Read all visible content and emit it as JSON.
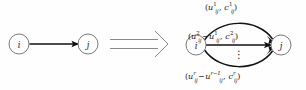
{
  "figure": {
    "background_color": "#fefefe",
    "stroke_color": "#111111",
    "node_stroke_color": "#6b6b6b",
    "implies_color": "#8a8a8a",
    "width": 306,
    "height": 90
  },
  "left_graph": {
    "name": "original-arc",
    "source_node": {
      "label": "i",
      "cx": 19,
      "cy": 44,
      "r": 10
    },
    "target_node": {
      "label": "j",
      "cx": 88,
      "cy": 44,
      "r": 10
    },
    "edge_count": 1
  },
  "implies": {
    "symbol": "⟹",
    "name": "implies-arrow"
  },
  "right_graph": {
    "name": "expanded-parallel-arcs",
    "source_node": {
      "label": "i",
      "cx": 196,
      "cy": 45,
      "r": 10
    },
    "target_node": {
      "label": "j",
      "cx": 281,
      "cy": 45,
      "r": 10
    },
    "arc_count": 3,
    "ellipsis": "⋮",
    "arcs": [
      {
        "position": "top",
        "label_plain": "(u_ij^1, c_ij^1)",
        "capacity": {
          "var": "u",
          "sub": "ij",
          "sup": "1"
        },
        "cost": {
          "var": "c",
          "sub": "ij",
          "sup": "1"
        },
        "subtract": null
      },
      {
        "position": "middle",
        "label_plain": "(u_ij^2 - u_ij^1, c_ij^2)",
        "capacity": {
          "var": "u",
          "sub": "ij",
          "sup": "2"
        },
        "subtract": {
          "var": "u",
          "sub": "ij",
          "sup": "1"
        },
        "cost": {
          "var": "c",
          "sub": "ij",
          "sup": "2"
        }
      },
      {
        "position": "bottom",
        "label_plain": "(u_ij^r - u_ij^{r-1}, c_ij^r)",
        "capacity": {
          "var": "u",
          "sub": "ij",
          "sup": "r"
        },
        "subtract": {
          "var": "u",
          "sub": "ij",
          "sup": "r-1"
        },
        "cost": {
          "var": "c",
          "sub": "ij",
          "sup": "r"
        }
      }
    ]
  },
  "text": {
    "node_i": "i",
    "node_j": "j",
    "u": "u",
    "c": "c",
    "ij": "ij",
    "sup_1": "1",
    "sup_2": "2",
    "sup_r": "r",
    "sup_r_minus_1": "r−1",
    "minus": "−",
    "lparen": "(",
    "rparen": ")",
    "comma": ",",
    "vdots": "⋮"
  }
}
